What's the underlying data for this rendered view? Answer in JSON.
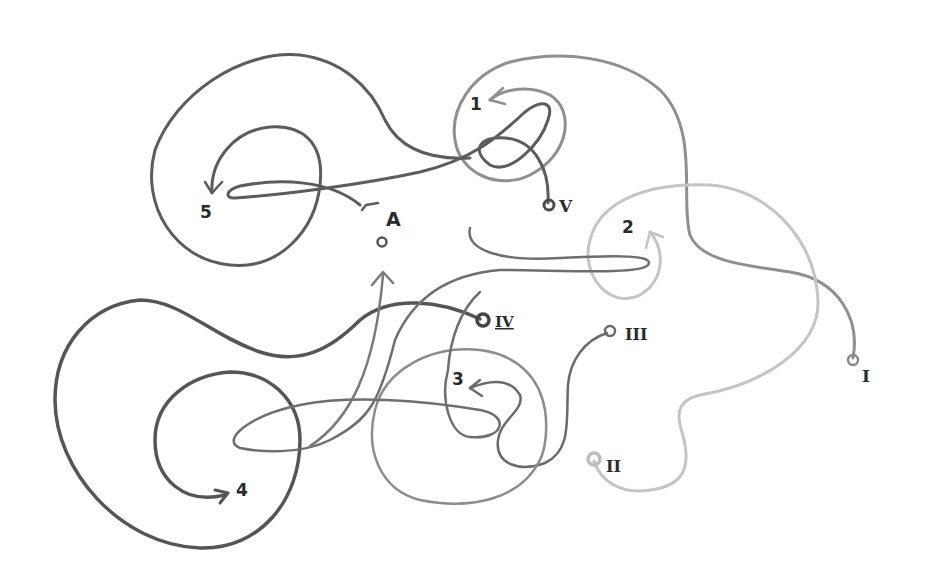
{
  "diagram": {
    "type": "tangled-lines-puzzle",
    "colors": {
      "background": "#ffffff",
      "dark": "#5a5a5a",
      "mid": "#8a8a8a",
      "light": "#b5b5b5",
      "lighter": "#c8c8c8",
      "text": "#2a2a2a"
    },
    "start_points": [
      {
        "id": "I",
        "label": "I"
      },
      {
        "id": "II",
        "label": "II"
      },
      {
        "id": "III",
        "label": "III"
      },
      {
        "id": "IV",
        "label": "IV"
      },
      {
        "id": "V",
        "label": "V"
      }
    ],
    "end_points": [
      {
        "id": "1",
        "label": "1"
      },
      {
        "id": "2",
        "label": "2"
      },
      {
        "id": "3",
        "label": "3"
      },
      {
        "id": "4",
        "label": "4"
      },
      {
        "id": "5",
        "label": "5"
      }
    ],
    "extra_point": {
      "id": "A",
      "label": "A"
    }
  }
}
